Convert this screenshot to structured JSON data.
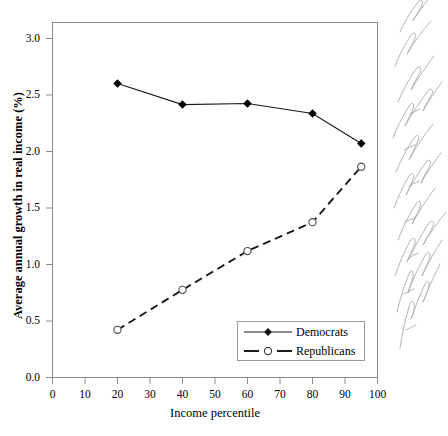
{
  "chart_data": {
    "type": "line",
    "title": "",
    "xlabel": "Income percentile",
    "ylabel": "Average annual growth in real income (%)",
    "xlim": [
      0,
      100
    ],
    "ylim": [
      0.0,
      3.2
    ],
    "xticks": [
      "0",
      "10",
      "20",
      "30",
      "40",
      "50",
      "60",
      "70",
      "80",
      "90",
      "100"
    ],
    "yticks": [
      "0.0",
      "0.5",
      "1.0",
      "1.5",
      "2.0",
      "2.5",
      "3.0"
    ],
    "grid": false,
    "legend_position": "lower right",
    "x": [
      20,
      40,
      60,
      80,
      95
    ],
    "series": [
      {
        "name": "Democrats",
        "values": [
          2.65,
          2.46,
          2.47,
          2.38,
          2.11
        ],
        "line_style": "solid",
        "marker": "filled-diamond",
        "color": "#000000"
      },
      {
        "name": "Republicans",
        "values": [
          0.43,
          0.79,
          1.14,
          1.4,
          1.9
        ],
        "line_style": "dashed",
        "marker": "open-circle",
        "color": "#000000"
      }
    ]
  },
  "legend": {
    "items": [
      {
        "label": "Democrats",
        "style": "solid-filled-diamond"
      },
      {
        "label": "Republicans",
        "style": "dashed-open-circle"
      }
    ]
  },
  "annotation": {
    "margin_note": "handwritten cursive note in right margin (illegible)"
  },
  "colors": {
    "axis": "#7d7d7d",
    "line": "#1a1a1a",
    "text": "#000000",
    "legend_border": "#9a9a9a"
  }
}
